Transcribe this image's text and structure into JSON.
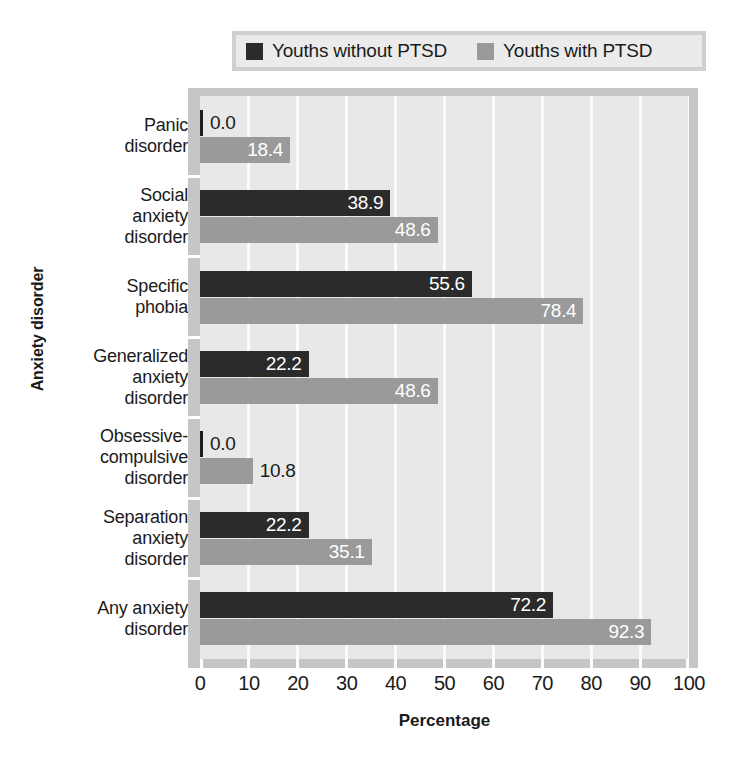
{
  "legend": {
    "entries": [
      {
        "label": "Youths without PTSD",
        "color": "#2b2b2b",
        "swatch_name": "legend-swatch-without-ptsd"
      },
      {
        "label": "Youths with PTSD",
        "color": "#9a9a9a",
        "swatch_name": "legend-swatch-with-ptsd"
      }
    ]
  },
  "axes": {
    "y_title": "Anxiety disorder",
    "x_title": "Percentage",
    "x_ticks": [
      "0",
      "10",
      "20",
      "30",
      "40",
      "50",
      "60",
      "70",
      "80",
      "90",
      "100"
    ]
  },
  "colors": {
    "series_without_ptsd": "#2b2b2b",
    "series_with_ptsd": "#9a9a9a",
    "plot_background": "#e8e8e8",
    "gridline": "#fbfbfb",
    "frame": "#c6c6c6",
    "legend_background": "#ebebeb",
    "legend_border": "#cfcfcf",
    "text": "#1b1b1b"
  },
  "categories": [
    {
      "lines": [
        "Panic",
        "disorder"
      ]
    },
    {
      "lines": [
        "Social",
        "anxiety",
        "disorder"
      ]
    },
    {
      "lines": [
        "Specific",
        "phobia"
      ]
    },
    {
      "lines": [
        "Generalized",
        "anxiety",
        "disorder"
      ]
    },
    {
      "lines": [
        "Obsessive-",
        "compulsive",
        "disorder"
      ]
    },
    {
      "lines": [
        "Separation",
        "anxiety",
        "disorder"
      ]
    },
    {
      "lines": [
        "Any anxiety",
        "disorder"
      ]
    }
  ],
  "bar_labels": {
    "panic_without": "0.0",
    "panic_with": "18.4",
    "social_without": "38.9",
    "social_with": "48.6",
    "specific_without": "55.6",
    "specific_with": "78.4",
    "generalized_without": "22.2",
    "generalized_with": "48.6",
    "ocd_without": "0.0",
    "ocd_with": "10.8",
    "separation_without": "22.2",
    "separation_with": "35.1",
    "any_without": "72.2",
    "any_with": "92.3"
  },
  "chart_data": {
    "type": "bar",
    "orientation": "horizontal",
    "title": "",
    "xlabel": "Percentage",
    "ylabel": "Anxiety disorder",
    "xlim": [
      0,
      100
    ],
    "xticks": [
      0,
      10,
      20,
      30,
      40,
      50,
      60,
      70,
      80,
      90,
      100
    ],
    "grid": "vertical-only",
    "legend_position": "top",
    "categories": [
      "Panic disorder",
      "Social anxiety disorder",
      "Specific phobia",
      "Generalized anxiety disorder",
      "Obsessive-compulsive disorder",
      "Separation anxiety disorder",
      "Any anxiety disorder"
    ],
    "series": [
      {
        "name": "Youths without PTSD",
        "color": "#2b2b2b",
        "values": [
          0.0,
          38.9,
          55.6,
          22.2,
          0.0,
          22.2,
          72.2
        ]
      },
      {
        "name": "Youths with PTSD",
        "color": "#9a9a9a",
        "values": [
          18.4,
          48.6,
          78.4,
          48.6,
          10.8,
          35.1,
          92.3
        ]
      }
    ],
    "data_labels": [
      [
        "0.0",
        "38.9",
        "55.6",
        "22.2",
        "0.0",
        "22.2",
        "72.2"
      ],
      [
        "18.4",
        "48.6",
        "78.4",
        "48.6",
        "10.8",
        "35.1",
        "92.3"
      ]
    ]
  }
}
